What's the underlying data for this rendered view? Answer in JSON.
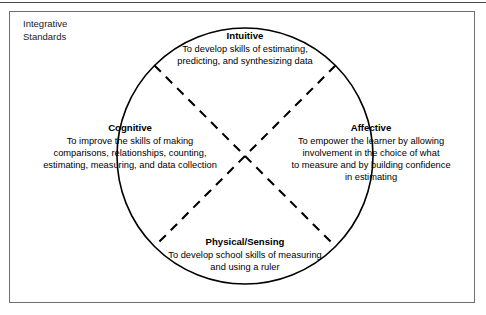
{
  "figure": {
    "caption_label": "Integrative\nStandards",
    "diagram_type": "venn-like circle divided into four quadrants by a dashed X",
    "colors": {
      "stroke": "#000000",
      "frame_border": "#6f6f6f",
      "top_rule": "#4a4a4a",
      "background": "#ffffff",
      "text": "#000000"
    },
    "geometry": {
      "circle_center_x": 245,
      "circle_center_y": 156,
      "circle_radius": 128,
      "dash_length": 9,
      "dash_gap": 7
    },
    "quadrants": [
      {
        "id": "intuitive",
        "position": "top",
        "title": "Intuitive",
        "description": "To develop skills of estimating,\npredicting, and synthesizing data"
      },
      {
        "id": "cognitive",
        "position": "left",
        "title": "Cognitive",
        "description": "To improve the skills of making\ncomparisons, relationships, counting,\nestimating, measuring, and data collection"
      },
      {
        "id": "affective",
        "position": "right",
        "title": "Affective",
        "description": "To empower the learner by allowing\ninvolvement in the choice of what\nto measure and by building confidence\nin estimating"
      },
      {
        "id": "physical-sensing",
        "position": "bottom",
        "title": "Physical/Sensing",
        "description": "To develop school skills of measuring\nand using a ruler"
      }
    ]
  }
}
